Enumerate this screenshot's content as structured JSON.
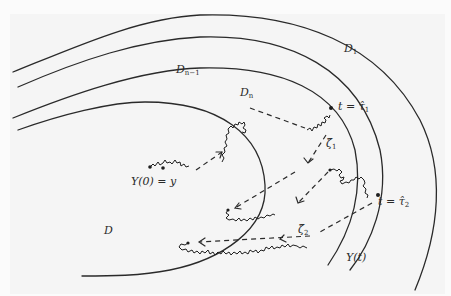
{
  "figure": {
    "type": "diagram",
    "colors": {
      "ink": "#2a2a2a",
      "background": "#f5f5f5"
    },
    "domains": [
      {
        "id": "D1",
        "label_main": "D",
        "label_sub": "1"
      },
      {
        "id": "Dn-1",
        "label_main": "D",
        "label_sub": "n−1"
      },
      {
        "id": "Dn",
        "label_main": "D",
        "label_sub": "n"
      },
      {
        "id": "D",
        "label_main": "D",
        "label_sub": ""
      }
    ],
    "labels": {
      "start": "Y(0) = y",
      "tau1": "t = τ̂",
      "tau1_sub": "1",
      "tau2": "t = τ̂",
      "tau2_sub": "2",
      "zeta1": "ζ̂",
      "zeta1_sub": "1",
      "zeta2": "ζ̂",
      "zeta2_sub": "2",
      "end": "Y(t)"
    }
  }
}
